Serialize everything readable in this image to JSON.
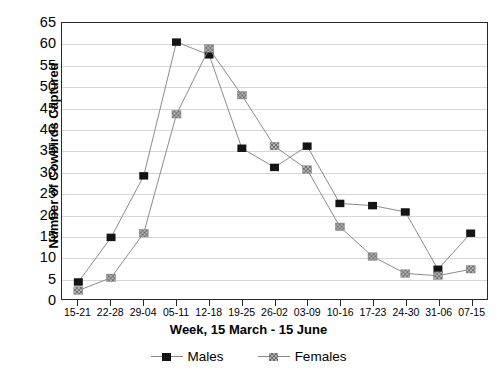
{
  "chart_data": {
    "type": "line",
    "title": "",
    "xlabel": "Week, 15 March - 15 June",
    "ylabel": "Number of Cowbirds Captured",
    "categories": [
      "15-21",
      "22-28",
      "29-04",
      "05-11",
      "12-18",
      "19-25",
      "26-02",
      "03-09",
      "10-16",
      "17-23",
      "24-30",
      "31-06",
      "07-15"
    ],
    "series": [
      {
        "name": "Males",
        "values": [
          4,
          14.5,
          29,
          60.5,
          57.5,
          35.5,
          31,
          36,
          22.5,
          22,
          20.5,
          7,
          15.5
        ]
      },
      {
        "name": "Females",
        "values": [
          2,
          5,
          15.5,
          43.5,
          59,
          48,
          36,
          30.5,
          17,
          10,
          6,
          5.5,
          7
        ]
      }
    ],
    "ylim": [
      0,
      65
    ],
    "yticks": [
      0,
      5,
      10,
      15,
      20,
      25,
      30,
      35,
      40,
      45,
      50,
      55,
      60,
      65
    ],
    "ytick_labels": [
      "0",
      "5",
      "10",
      "15",
      "20",
      "25",
      "30",
      "35",
      "40",
      "45",
      "50",
      "55",
      "60",
      "65"
    ],
    "grid": true,
    "grid_axis": "y",
    "legend_position": "bottom",
    "legend": [
      "Males",
      "Females"
    ],
    "colors": {
      "males_marker": "#141414",
      "females_marker": "#a8a8a8",
      "line": "#8a8a8a",
      "gridline": "#d6d6d6",
      "axis": "#2a2a2a",
      "text": "#000000",
      "background": "#ffffff"
    }
  }
}
